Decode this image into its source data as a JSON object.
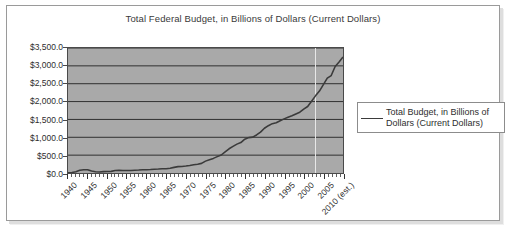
{
  "chart_data": {
    "type": "line",
    "title": "Total Federal Budget, in Billions of Dollars (Current Dollars)",
    "xlabel": "",
    "ylabel": "",
    "ylim": [
      0,
      3500
    ],
    "ytick_labels": [
      "$3,500.0",
      "$3,000.0",
      "$2,500.0",
      "$2,000.0",
      "$1,500.0",
      "$1,000.0",
      "$500.0",
      "$0.0"
    ],
    "ytick_values": [
      3500,
      3000,
      2500,
      2000,
      1500,
      1000,
      500,
      0
    ],
    "xtick_labels": [
      "1940",
      "1945",
      "1950",
      "1955",
      "1960",
      "1965",
      "1970",
      "1975",
      "1980",
      "1985",
      "1990",
      "1995",
      "2000",
      "2005",
      "2010 (est.)"
    ],
    "xtick_values": [
      1940,
      1945,
      1950,
      1955,
      1960,
      1965,
      1970,
      1975,
      1980,
      1985,
      1990,
      1995,
      2000,
      2005,
      2010
    ],
    "xlim": [
      1940,
      2010
    ],
    "grid": "horizontal",
    "legend_position": "right",
    "plot_background": "#a9a9a9",
    "line_color": "#3b3b3b",
    "series": [
      {
        "name": "Total Budget, in Billions of Dollars (Current Dollars)",
        "x": [
          1940,
          1941,
          1942,
          1943,
          1944,
          1945,
          1946,
          1947,
          1948,
          1949,
          1950,
          1951,
          1952,
          1953,
          1954,
          1955,
          1956,
          1957,
          1958,
          1959,
          1960,
          1961,
          1962,
          1963,
          1964,
          1965,
          1966,
          1967,
          1968,
          1969,
          1970,
          1971,
          1972,
          1973,
          1974,
          1975,
          1976,
          1977,
          1978,
          1979,
          1980,
          1981,
          1982,
          1983,
          1984,
          1985,
          1986,
          1987,
          1988,
          1989,
          1990,
          1991,
          1992,
          1993,
          1994,
          1995,
          1996,
          1997,
          1998,
          1999,
          2000,
          2001,
          2002,
          2003,
          2004,
          2005,
          2006,
          2007,
          2008,
          2009,
          2010
        ],
        "values": [
          9.5,
          13.7,
          35.1,
          78.6,
          91.3,
          92.7,
          55.2,
          34.5,
          29.8,
          38.8,
          42.6,
          45.5,
          67.7,
          76.1,
          70.9,
          68.4,
          70.6,
          76.6,
          82.4,
          92.1,
          92.2,
          97.7,
          106.8,
          111.3,
          118.5,
          118.2,
          134.5,
          157.5,
          178.1,
          183.6,
          195.6,
          210.2,
          230.7,
          245.7,
          269.4,
          332.3,
          371.8,
          409.2,
          458.7,
          504.0,
          590.9,
          678.2,
          745.7,
          808.4,
          851.8,
          946.3,
          990.4,
          1004.0,
          1064.4,
          1143.7,
          1253.0,
          1324.2,
          1381.5,
          1409.4,
          1461.8,
          1515.7,
          1560.5,
          1601.1,
          1652.5,
          1701.8,
          1789.0,
          1862.8,
          2010.9,
          2159.9,
          2292.8,
          2472.0,
          2655.1,
          2728.7,
          2982.5,
          3107.4,
          3250.0
        ]
      }
    ]
  },
  "legend": {
    "entry_label": "Total Budget, in Billions of Dollars (Current Dollars)"
  }
}
